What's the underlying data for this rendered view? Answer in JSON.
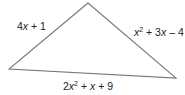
{
  "diagram": {
    "type": "triangle",
    "stroke_color": "#777777",
    "vertices": {
      "top": [
        88,
        3
      ],
      "left": [
        9,
        69
      ],
      "right": [
        176,
        78
      ]
    },
    "sides": {
      "left": {
        "label": "4x + 1",
        "coef": "4",
        "var": "x",
        "rest": " + 1"
      },
      "right": {
        "label": "x^2 + 3x - 4",
        "var": "x",
        "exp": "2",
        "mid": " + 3",
        "var2": "x",
        "rest": " – 4"
      },
      "bottom": {
        "label": "2x^2 + x + 9",
        "coef": "2",
        "var": "x",
        "exp": "2",
        "mid": " + ",
        "var2": "x",
        "rest": " + 9"
      }
    }
  }
}
